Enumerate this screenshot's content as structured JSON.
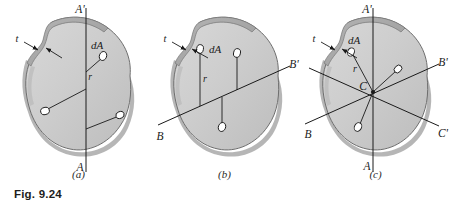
{
  "figure": {
    "caption": "Fig. 9.24",
    "background_color": "#ffffff",
    "shape_fill_color": "#cccccc",
    "shape_rim_color": "#a8a8a8",
    "shape_outline_color": "#6e6e6e",
    "axis_line_color": "#1a1a1a",
    "element_fill_color": "#ffffff"
  },
  "panels": [
    {
      "id": "a",
      "label": "(a)",
      "description": "Thin plate with vertical axis A-A' and radial distances r to area elements",
      "axis_top_label": "A'",
      "axis_bottom_label": "A",
      "thickness_label": "t",
      "area_element_label": "dA",
      "radius_label": "r",
      "axes": [
        {
          "name": "A-A'",
          "orientation": "vertical",
          "start_label": "A",
          "end_label": "A'"
        }
      ],
      "area_elements": 3
    },
    {
      "id": "b",
      "label": "(b)",
      "description": "Thin plate with inclined axis B-B' and perpendicular distances r to area elements",
      "axis_left_label": "B",
      "axis_right_label": "B'",
      "thickness_label": "t",
      "area_element_label": "dA",
      "radius_label": "r",
      "axes": [
        {
          "name": "B-B'",
          "orientation": "inclined",
          "start_label": "B",
          "end_label": "B'"
        }
      ],
      "area_elements": 3
    },
    {
      "id": "c",
      "label": "(c)",
      "description": "Thin plate with three concurrent axes A-A', B-B', C-C' through centroid C",
      "axis_top_label": "A'",
      "axis_bottom_label": "A",
      "axis_left_label": "B",
      "axis_right_label": "B'",
      "axis_lower_right_label": "C'",
      "centroid_label": "C",
      "thickness_label": "t",
      "area_element_label": "dA",
      "radius_label": "r",
      "axes": [
        {
          "name": "A-A'",
          "orientation": "vertical",
          "start_label": "A",
          "end_label": "A'"
        },
        {
          "name": "B-B'",
          "orientation": "inclined-up",
          "start_label": "B",
          "end_label": "B'"
        },
        {
          "name": "C-C'",
          "orientation": "inclined-down",
          "start_label": "C",
          "end_label": "C'"
        }
      ],
      "area_elements": 3
    }
  ]
}
